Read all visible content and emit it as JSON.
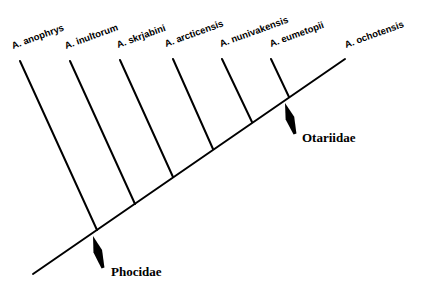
{
  "diagram": {
    "type": "cladogram",
    "taxa": [
      {
        "label": "A. anophrys",
        "tip": [
          20,
          61
        ],
        "node": [
          97,
          230
        ],
        "label_pos": [
          13,
          49
        ]
      },
      {
        "label": "A. inultorum",
        "tip": [
          70,
          61
        ],
        "node": [
          135,
          204
        ],
        "label_pos": [
          66,
          49
        ]
      },
      {
        "label": "A. skrjabini",
        "tip": [
          120,
          60
        ],
        "node": [
          173,
          177
        ],
        "label_pos": [
          118,
          48
        ]
      },
      {
        "label": "A. arcticensis",
        "tip": [
          173,
          59
        ],
        "node": [
          213,
          149
        ],
        "label_pos": [
          166,
          47
        ]
      },
      {
        "label": "A. nunivakensis",
        "tip": [
          222,
          59
        ],
        "node": [
          252,
          122
        ],
        "label_pos": [
          221,
          47
        ]
      },
      {
        "label": "A. eumetopii",
        "tip": [
          271,
          59
        ],
        "node": [
          289,
          97
        ],
        "label_pos": [
          271,
          47
        ]
      },
      {
        "label": "A. ochotensis",
        "tip": [
          345,
          59
        ],
        "node": null,
        "label_pos": [
          346,
          48
        ]
      }
    ],
    "backbone": {
      "start": [
        33,
        274
      ],
      "end": [
        345,
        59
      ]
    },
    "groups": [
      {
        "label": "Phocidae",
        "arrow_tip": [
          93,
          236
        ],
        "arrow_tail": [
          103,
          268
        ],
        "label_pos": [
          111,
          276
        ]
      },
      {
        "label": "Otariidae",
        "arrow_tip": [
          285,
          103
        ],
        "arrow_tail": [
          295,
          134
        ],
        "label_pos": [
          302,
          142
        ]
      }
    ],
    "colors": {
      "line": "#000000",
      "background": "#ffffff"
    }
  }
}
